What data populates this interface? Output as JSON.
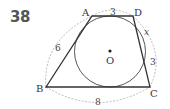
{
  "problem": {
    "number": "38"
  },
  "figure": {
    "vertices": {
      "A": "A",
      "B": "B",
      "C": "C",
      "D": "D"
    },
    "center": "O",
    "lengths": {
      "AD": "3",
      "AB": "6",
      "BC": "8",
      "DC_upper": "x",
      "DC_lower": "3"
    },
    "colors": {
      "line": "#333333",
      "dashed": "#aaaaaa",
      "label": "#333333"
    }
  }
}
